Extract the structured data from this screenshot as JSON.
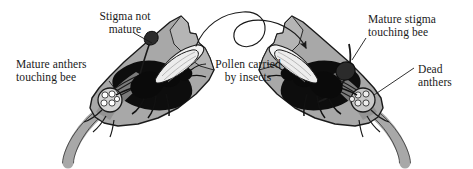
{
  "figure": {
    "width": 473,
    "height": 169,
    "background_color": "#ffffff"
  },
  "colors": {
    "petal_fill": "#a8a8a8",
    "petal_fill_light": "#bdbdbd",
    "petal_shadow": "#8f8f8f",
    "bee_body": "#000000",
    "wing_fill": "#f2f2f2",
    "outline": "#1a1a1a",
    "text": "#1a1a1a",
    "anther_fill": "#d4d4d4"
  },
  "labels": [
    {
      "id": "stigma-not-mature",
      "text": "Stigma not\nmature",
      "line1": "Stigma not",
      "line2": "mature",
      "target": "left-flower-stigma"
    },
    {
      "id": "mature-anthers-touching-bee",
      "text": "Mature anthers\ntouching bee",
      "line1": "Mature anthers",
      "line2": "touching bee",
      "target": "left-flower-anthers"
    },
    {
      "id": "pollen-carried-by-insects",
      "text": "Pollen carried\nby insects",
      "line1": "Pollen carried",
      "line2": "by insects",
      "target": "transfer-arrow"
    },
    {
      "id": "mature-stigma-touching-bee",
      "text": "Mature stigma\ntouching bee",
      "line1": "Mature stigma",
      "line2": "touching bee",
      "target": "right-flower-stigma"
    },
    {
      "id": "dead-anthers",
      "text": "Dead\nanthers",
      "line1": "Dead",
      "line2": "anthers",
      "target": "right-flower-anthers"
    }
  ],
  "flowers": [
    {
      "id": "left-flower",
      "side": "left",
      "stage": "male phase",
      "stigma_state": "not mature",
      "anther_state": "mature, touching bee",
      "contains_bee": true
    },
    {
      "id": "right-flower",
      "side": "right",
      "stage": "female phase",
      "stigma_state": "mature, touching bee",
      "anther_state": "dead",
      "contains_bee": true
    }
  ],
  "arrow": {
    "id": "transfer-arrow",
    "description": "looping arrow from left flower to right flower",
    "direction": "left-to-right"
  }
}
